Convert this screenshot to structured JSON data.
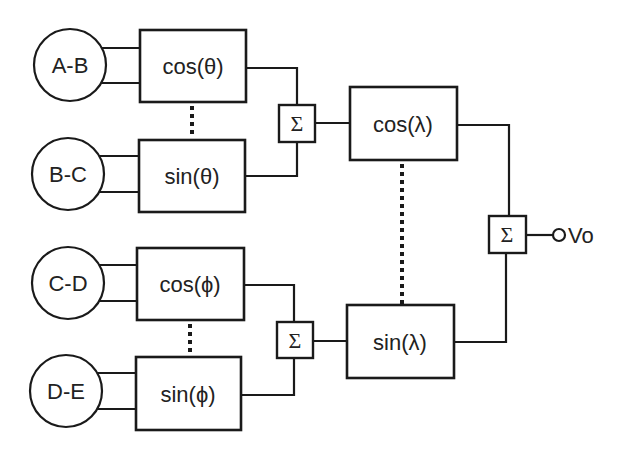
{
  "diagram": {
    "title": "",
    "nodes": {
      "ab": "A-B",
      "bc": "B-C",
      "cd": "C-D",
      "de": "D-E"
    },
    "blocks": {
      "cos_theta": "cos(θ)",
      "sin_theta": "sin(θ)",
      "cos_phi": "cos(ϕ)",
      "sin_phi": "sin(ϕ)",
      "cos_lambda": "cos(λ)",
      "sin_lambda": "sin(λ)"
    },
    "summers": {
      "theta_sum": "Σ",
      "phi_sum": "Σ",
      "output_sum": "Σ"
    },
    "output": {
      "label": "Vo"
    },
    "colors": {
      "stroke": "#1a1a1a",
      "text": "#222222",
      "background": "#ffffff"
    }
  }
}
